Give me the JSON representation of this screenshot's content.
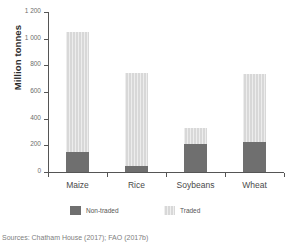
{
  "chart_data": {
    "type": "bar",
    "subtype": "stacked-vertical",
    "title": "",
    "subtitle": "",
    "xlabel": "",
    "ylabel": "Million tonnes",
    "categories": [
      "Maize",
      "Rice",
      "Soybeans",
      "Wheat"
    ],
    "series": [
      {
        "name": "Non-traded",
        "color": "#6f6f6f",
        "values": [
          150,
          48,
          210,
          225
        ]
      },
      {
        "name": "Traded",
        "color": "#d8d8d8",
        "values": [
          898,
          692,
          120,
          508
        ]
      }
    ],
    "totals": [
      1048,
      740,
      330,
      733
    ],
    "ylim": [
      0,
      1200
    ],
    "yticks": [
      0,
      200,
      400,
      600,
      800,
      1000,
      1200
    ],
    "ytick_labels": [
      "0",
      "200",
      "400",
      "600",
      "800",
      "1 000",
      "1 200"
    ],
    "grid": false,
    "legend_position": "bottom"
  },
  "axis": {
    "y_title": "Million tonnes",
    "y_ticks": [
      {
        "label": "1 200",
        "value": 1200
      },
      {
        "label": "1 000",
        "value": 1000
      },
      {
        "label": "800",
        "value": 800
      },
      {
        "label": "600",
        "value": 600
      },
      {
        "label": "400",
        "value": 400
      },
      {
        "label": "200",
        "value": 200
      },
      {
        "label": "0",
        "value": 0
      }
    ],
    "x_categories": [
      "Maize",
      "Rice",
      "Soybeans",
      "Wheat"
    ]
  },
  "legend": {
    "items": [
      {
        "label": "Non-traded",
        "color": "#6f6f6f"
      },
      {
        "label": "Traded",
        "color": "#d8d8d8"
      }
    ]
  },
  "footer": {
    "source": "Sources: Chatham House (2017); FAO (2017b)"
  },
  "colors": {
    "non_traded": "#6f6f6f",
    "traded": "#d8d8d8",
    "axis": "#555555",
    "background": "#ffffff"
  }
}
